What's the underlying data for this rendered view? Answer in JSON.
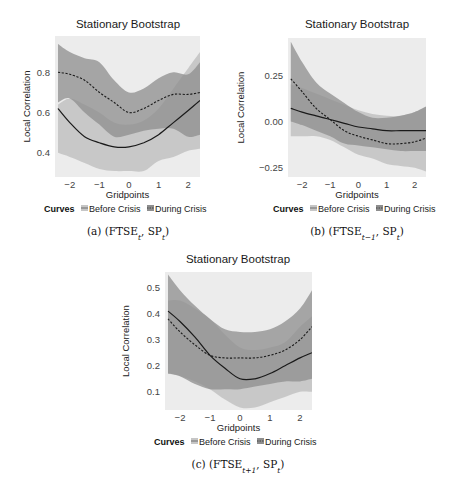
{
  "chart_data": [
    {
      "id": "a",
      "type": "line",
      "title": "Stationary Bootstrap",
      "xlabel": "Gridpoints",
      "ylabel": "Local Correlation",
      "caption": "(a) (FTSE",
      "caption_parts": {
        "label": "(a)",
        "series1": "FTSE",
        "sub1": "t",
        "series2": "SP",
        "sub2": "t"
      },
      "xlim": [
        -2.5,
        2.4
      ],
      "ylim": [
        0.28,
        0.98
      ],
      "xticks": [
        -2,
        -1,
        0,
        1,
        2
      ],
      "xtick_labels": [
        "−2",
        "−1",
        "0",
        "1",
        "2"
      ],
      "yticks": [
        0.4,
        0.6,
        0.8
      ],
      "ytick_labels": [
        "0.4",
        "0.6",
        "0.8"
      ],
      "legend": {
        "title": "Curves",
        "entries": [
          "Before Crisis",
          "During Crisis"
        ]
      },
      "x": [
        -2.4,
        -2.0,
        -1.5,
        -1.0,
        -0.5,
        0.0,
        0.5,
        1.0,
        1.5,
        2.0,
        2.4
      ],
      "series": [
        {
          "name": "Before Crisis",
          "style": "solid",
          "values": [
            0.62,
            0.55,
            0.48,
            0.45,
            0.43,
            0.43,
            0.45,
            0.49,
            0.55,
            0.61,
            0.66
          ],
          "lower": [
            0.4,
            0.38,
            0.35,
            0.32,
            0.31,
            0.31,
            0.31,
            0.36,
            0.38,
            0.41,
            0.42
          ],
          "upper": [
            0.64,
            0.67,
            0.64,
            0.6,
            0.55,
            0.54,
            0.56,
            0.62,
            0.72,
            0.82,
            0.9
          ]
        },
        {
          "name": "During Crisis",
          "style": "dashed",
          "values": [
            0.8,
            0.79,
            0.76,
            0.7,
            0.65,
            0.6,
            0.62,
            0.66,
            0.69,
            0.69,
            0.7
          ],
          "lower": [
            0.65,
            0.67,
            0.6,
            0.54,
            0.48,
            0.49,
            0.51,
            0.52,
            0.52,
            0.48,
            0.49
          ],
          "upper": [
            0.94,
            0.9,
            0.87,
            0.85,
            0.76,
            0.7,
            0.72,
            0.77,
            0.8,
            0.79,
            0.85
          ]
        }
      ]
    },
    {
      "id": "b",
      "type": "line",
      "title": "Stationary Bootstrap",
      "xlabel": "Gridpoints",
      "ylabel": "Local Correlation",
      "caption_parts": {
        "label": "(b)",
        "series1": "FTSE",
        "sub1": "t−1",
        "series2": "SP",
        "sub2": "t"
      },
      "xlim": [
        -2.5,
        2.4
      ],
      "ylim": [
        -0.3,
        0.45
      ],
      "xticks": [
        -2,
        -1,
        0,
        1,
        2
      ],
      "xtick_labels": [
        "−2",
        "−1",
        "0",
        "1",
        "2"
      ],
      "yticks": [
        -0.25,
        0.0,
        0.25
      ],
      "ytick_labels": [
        "−0.25",
        "0.00",
        "0.25"
      ],
      "legend": {
        "title": "Curves",
        "entries": [
          "Before Crisis",
          "During Crisis"
        ]
      },
      "x": [
        -2.4,
        -2.0,
        -1.5,
        -1.0,
        -0.5,
        0.0,
        0.5,
        1.0,
        1.5,
        2.0,
        2.4
      ],
      "series": [
        {
          "name": "Before Crisis",
          "style": "solid",
          "values": [
            0.07,
            0.05,
            0.03,
            0.01,
            -0.01,
            -0.03,
            -0.04,
            -0.05,
            -0.05,
            -0.05,
            -0.05
          ],
          "lower": [
            -0.08,
            -0.08,
            -0.08,
            -0.1,
            -0.14,
            -0.18,
            -0.2,
            -0.23,
            -0.24,
            -0.25,
            -0.27
          ],
          "upper": [
            0.2,
            0.18,
            0.15,
            0.12,
            0.09,
            0.06,
            0.04,
            0.03,
            0.03,
            0.05,
            0.08
          ]
        },
        {
          "name": "During Crisis",
          "style": "dashed",
          "values": [
            0.23,
            0.16,
            0.07,
            0.01,
            -0.05,
            -0.08,
            -0.1,
            -0.12,
            -0.12,
            -0.11,
            -0.09
          ],
          "lower": [
            0.0,
            -0.02,
            -0.05,
            -0.08,
            -0.12,
            -0.13,
            -0.14,
            -0.15,
            -0.16,
            -0.16,
            -0.16
          ],
          "upper": [
            0.43,
            0.32,
            0.21,
            0.15,
            0.1,
            0.05,
            0.02,
            0.02,
            0.03,
            0.05,
            0.08
          ]
        }
      ]
    },
    {
      "id": "c",
      "type": "line",
      "title": "Stationary Bootstrap",
      "xlabel": "Gridpoints",
      "ylabel": "Local Correlation",
      "caption_parts": {
        "label": "(c)",
        "series1": "FTSE",
        "sub1": "t+1",
        "series2": "SP",
        "sub2": "t"
      },
      "xlim": [
        -2.5,
        2.4
      ],
      "ylim": [
        0.03,
        0.56
      ],
      "xticks": [
        -2,
        -1,
        0,
        1,
        2
      ],
      "xtick_labels": [
        "−2",
        "−1",
        "0",
        "1",
        "2"
      ],
      "yticks": [
        0.1,
        0.2,
        0.3,
        0.4,
        0.5
      ],
      "ytick_labels": [
        "0.1",
        "0.2",
        "0.3",
        "0.4",
        "0.5"
      ],
      "legend": {
        "title": "Curves",
        "entries": [
          "Before Crisis",
          "During Crisis"
        ]
      },
      "x": [
        -2.4,
        -2.0,
        -1.5,
        -1.0,
        -0.5,
        0.0,
        0.5,
        1.0,
        1.5,
        2.0,
        2.4
      ],
      "series": [
        {
          "name": "Before Crisis",
          "style": "solid",
          "values": [
            0.41,
            0.37,
            0.31,
            0.24,
            0.19,
            0.15,
            0.15,
            0.17,
            0.2,
            0.23,
            0.25
          ],
          "lower": [
            0.17,
            0.16,
            0.14,
            0.11,
            0.07,
            0.04,
            0.04,
            0.06,
            0.08,
            0.1,
            0.1
          ],
          "upper": [
            0.45,
            0.45,
            0.42,
            0.38,
            0.32,
            0.27,
            0.26,
            0.27,
            0.29,
            0.35,
            0.39
          ]
        },
        {
          "name": "During Crisis",
          "style": "dashed",
          "values": [
            0.38,
            0.33,
            0.28,
            0.24,
            0.23,
            0.23,
            0.23,
            0.24,
            0.26,
            0.3,
            0.35
          ],
          "lower": [
            0.17,
            0.16,
            0.13,
            0.11,
            0.11,
            0.11,
            0.12,
            0.13,
            0.14,
            0.14,
            0.15
          ],
          "upper": [
            0.55,
            0.49,
            0.43,
            0.38,
            0.34,
            0.33,
            0.33,
            0.34,
            0.37,
            0.42,
            0.49
          ]
        }
      ]
    }
  ],
  "colors": {
    "panel_bg": "#ececec",
    "before_band": "#c6c6c6",
    "during_band": "#8e8e8e",
    "line": "#1a1a1a",
    "text": "#333333"
  }
}
